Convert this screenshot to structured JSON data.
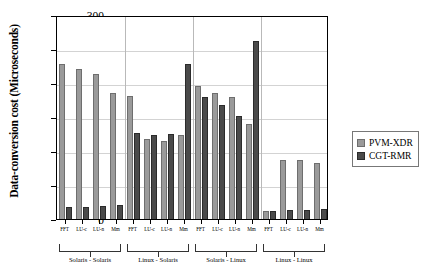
{
  "chart_data": {
    "type": "bar",
    "title": "",
    "xlabel": "",
    "ylabel": "Data-conversion cost (Microseconds)",
    "ylim": [
      0,
      300
    ],
    "yticks": [
      0,
      50,
      100,
      150,
      200,
      250,
      300
    ],
    "grid": true,
    "legend_position": "right",
    "categories": [
      "FFT",
      "LU-c",
      "LU-n",
      "Mm",
      "FFT",
      "LU-c",
      "LU-n",
      "Mm",
      "FFT",
      "LU-c",
      "LU-n",
      "Mm",
      "FFT",
      "LU-c",
      "LU-n",
      "Mm"
    ],
    "groups": [
      {
        "label": "Solaris - Solaris",
        "categories": [
          "FFT",
          "LU-c",
          "LU-n",
          "Mm"
        ]
      },
      {
        "label": "Linux - Solaris",
        "categories": [
          "FFT",
          "LU-c",
          "LU-n",
          "Mm"
        ]
      },
      {
        "label": "Solaris - Linux",
        "categories": [
          "FFT",
          "LU-c",
          "LU-n",
          "Mm"
        ]
      },
      {
        "label": "Linux - Linux",
        "categories": [
          "FFT",
          "LU-c",
          "LU-n",
          "Mm"
        ]
      }
    ],
    "series": [
      {
        "name": "PVM-XDR",
        "color": "#9a9a9a",
        "values": [
          228,
          220,
          213,
          185,
          181,
          118,
          115,
          123,
          196,
          186,
          180,
          140,
          12,
          87,
          87,
          83
        ]
      },
      {
        "name": "CGT-RMR",
        "color": "#4a4a4a",
        "values": [
          18,
          18,
          19,
          21,
          127,
          123,
          125,
          228,
          179,
          168,
          152,
          262,
          12,
          13,
          13,
          14
        ]
      }
    ]
  },
  "legend": {
    "items": [
      {
        "label": "PVM-XDR",
        "swatch": "light"
      },
      {
        "label": "CGT-RMR",
        "swatch": "dark"
      }
    ]
  }
}
